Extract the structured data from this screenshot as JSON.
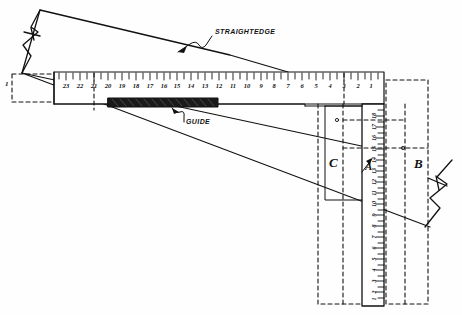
{
  "figure": {
    "ink_color": "#111111",
    "paper_color": "#fefefe",
    "guide_fill": "#1a1a1a"
  },
  "callouts": [
    {
      "id": "straightedge",
      "text": "STRAIGHTEDGE",
      "x": 215,
      "y": 33
    },
    {
      "id": "guide",
      "text": "GUIDE",
      "x": 186,
      "y": 123
    }
  ],
  "zone_labels": [
    {
      "id": "zone-c",
      "text": "C",
      "x": 329,
      "y": 162
    },
    {
      "id": "zone-b",
      "text": "B",
      "x": 414,
      "y": 163
    },
    {
      "id": "zone-a",
      "text": "A",
      "x": 368,
      "y": 165
    }
  ],
  "edge_marks": [
    {
      "id": "left-edge-one",
      "text": "1",
      "x": 5,
      "y": 84
    }
  ],
  "horizontal_ruler": {
    "name": "horizontal-ruler",
    "x_left": 54,
    "x_right": 384,
    "y_top": 72,
    "y_bottom": 104,
    "label_y": 85,
    "tick_top": 73,
    "tick_major_len": 8,
    "tick_minor_len": 5,
    "numbers": [
      23,
      22,
      21,
      20,
      19,
      18,
      17,
      16,
      15,
      14,
      13,
      12,
      11,
      10,
      9,
      8,
      7,
      6,
      5,
      4,
      3,
      2,
      1
    ],
    "number_x": [
      66,
      80,
      94,
      108,
      122,
      136,
      150,
      164,
      177,
      191,
      205,
      219,
      233,
      247,
      261,
      274,
      288,
      302,
      316,
      330,
      344,
      358,
      371
    ]
  },
  "vertical_ruler": {
    "name": "vertical-ruler",
    "x_left": 362,
    "x_right": 384,
    "y_top": 104,
    "y_bottom": 306,
    "label_x": 374,
    "numbers": [
      18,
      17,
      16,
      15,
      14,
      13,
      12,
      11,
      10,
      9,
      8,
      7,
      6,
      5,
      4,
      3,
      2,
      1
    ],
    "number_y": [
      116,
      127,
      138,
      149,
      160,
      171,
      182,
      193,
      204,
      215,
      226,
      237,
      248,
      259,
      270,
      281,
      292,
      299
    ]
  },
  "guide_bar": {
    "name": "guide-bar",
    "x": 108,
    "y": 98,
    "width": 110,
    "height": 9
  },
  "dashed_regions": [
    {
      "id": "dashed-left-box",
      "x": 12,
      "y": 74,
      "width": 42,
      "height": 28
    },
    {
      "id": "dashed-zone-c-outer",
      "x": 318,
      "y": 104,
      "width": 42,
      "height": 200
    },
    {
      "id": "dashed-zone-b-outer",
      "x": 386,
      "y": 78,
      "width": 42,
      "height": 226
    }
  ]
}
